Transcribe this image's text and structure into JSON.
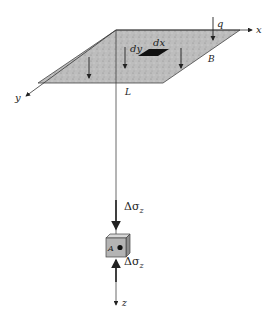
{
  "figure": {
    "axes": {
      "x": "x",
      "y": "y",
      "z": "z"
    },
    "load": "q",
    "dimensions": {
      "width": "B",
      "length": "L"
    },
    "element": {
      "dx": "dx",
      "dy": "dy"
    },
    "point": "A",
    "stress": "Δσ",
    "stress_sub": "z",
    "colors": {
      "fill": "#b9b9b9",
      "line": "#333333",
      "element": "#111111"
    }
  }
}
